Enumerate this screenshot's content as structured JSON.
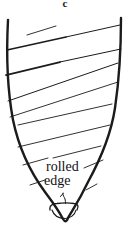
{
  "figure": {
    "top_label": "c",
    "annotation": {
      "line1": "rolled",
      "line2": "edge"
    }
  },
  "colors": {
    "ink": "#1b1b1b",
    "background": "#ffffff"
  }
}
